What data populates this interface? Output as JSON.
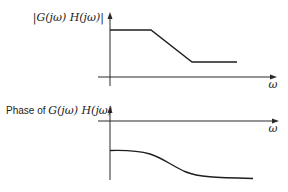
{
  "diagram": {
    "colors": {
      "background": "#ffffff",
      "ink": "#222222"
    },
    "magnitude_plot": {
      "ylabel": "|G(jω) H(jω)|",
      "xlabel": "ω",
      "curve_description": "flat at high level, linear roll-off, then flat at lower level"
    },
    "phase_plot": {
      "ylabel_prefix": "Phase of ",
      "ylabel_math": "G(jω) H(jω)",
      "xlabel": "ω",
      "curve_description": "starts flat below zero, smoothly decreases, then levels off at a lower value"
    }
  }
}
